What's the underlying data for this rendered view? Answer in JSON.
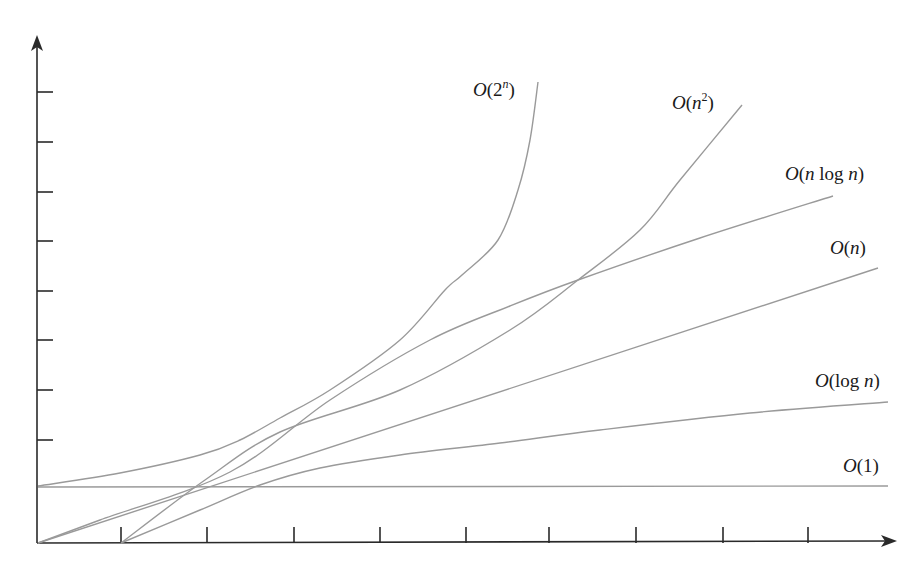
{
  "chart_data": {
    "type": "line",
    "title": "",
    "xlabel": "",
    "ylabel": "",
    "grid": false,
    "legend_position": "inline-labels",
    "axes": {
      "origin_px": [
        38,
        543
      ],
      "x_axis_end_px": [
        897,
        541
      ],
      "y_axis_end_px": [
        37,
        35
      ],
      "x_tick_px": [
        121,
        207,
        294,
        380,
        466,
        549,
        636,
        723,
        808
      ],
      "y_tick_px": [
        92,
        142,
        192,
        241,
        291,
        340,
        390,
        440
      ],
      "x_tick_labels": [],
      "y_tick_labels": []
    },
    "series": [
      {
        "name": "O(1)",
        "label_parts": [
          "O",
          "(",
          "1",
          ")"
        ],
        "color": "#9a9a9a",
        "points_px": [
          [
            38,
            487
          ],
          [
            888,
            486
          ]
        ],
        "label_pos": [
          843,
          472
        ]
      },
      {
        "name": "O(log n)",
        "color": "#9a9a9a",
        "points_px": [
          [
            121,
            543
          ],
          [
            200,
            510
          ],
          [
            260,
            485
          ],
          [
            320,
            468
          ],
          [
            400,
            455
          ],
          [
            500,
            443
          ],
          [
            600,
            430
          ],
          [
            750,
            413
          ],
          [
            888,
            402
          ]
        ],
        "label_pos": [
          815,
          387
        ]
      },
      {
        "name": "O(n)",
        "color": "#9a9a9a",
        "points_px": [
          [
            38,
            543
          ],
          [
            878,
            268
          ]
        ],
        "label_pos": [
          830,
          254
        ]
      },
      {
        "name": "O(n log n)",
        "color": "#9a9a9a",
        "points_px": [
          [
            38,
            543
          ],
          [
            100,
            520
          ],
          [
            230,
            472
          ],
          [
            330,
            400
          ],
          [
            430,
            340
          ],
          [
            510,
            306
          ],
          [
            578,
            280
          ],
          [
            700,
            238
          ],
          [
            833,
            196
          ]
        ],
        "label_pos": [
          785,
          180
        ]
      },
      {
        "name": "O(n^2)",
        "color": "#9a9a9a",
        "points_px": [
          [
            121,
            543
          ],
          [
            205,
            480
          ],
          [
            280,
            432
          ],
          [
            400,
            390
          ],
          [
            510,
            330
          ],
          [
            578,
            280
          ],
          [
            640,
            230
          ],
          [
            680,
            180
          ],
          [
            742,
            105
          ]
        ],
        "label_pos": [
          672,
          109
        ]
      },
      {
        "name": "O(2^n)",
        "color": "#9a9a9a",
        "points_px": [
          [
            38,
            486
          ],
          [
            120,
            473
          ],
          [
            200,
            455
          ],
          [
            240,
            440
          ],
          [
            280,
            418
          ],
          [
            330,
            390
          ],
          [
            400,
            340
          ],
          [
            445,
            290
          ],
          [
            462,
            275
          ],
          [
            498,
            240
          ],
          [
            518,
            190
          ],
          [
            530,
            140
          ],
          [
            538,
            82
          ]
        ],
        "label_pos": [
          473,
          96
        ]
      }
    ]
  }
}
